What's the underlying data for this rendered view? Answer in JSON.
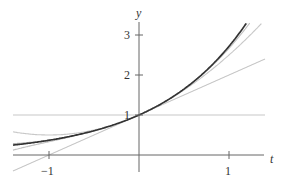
{
  "chart_data": {
    "type": "line",
    "title": "",
    "xlabel": "t",
    "ylabel": "y",
    "xlim": [
      -1.4,
      1.4
    ],
    "ylim": [
      -0.4,
      3.3
    ],
    "grid": false,
    "x_ticks": [
      {
        "value": -1,
        "label": "−1"
      },
      {
        "value": 1,
        "label": "1"
      }
    ],
    "y_ticks": [
      {
        "value": 1,
        "label": "1"
      },
      {
        "value": 2,
        "label": "2"
      },
      {
        "value": 3,
        "label": "3"
      }
    ],
    "series": [
      {
        "name": "e^t",
        "expr": "exp",
        "color": "#333333",
        "width": 1.6
      },
      {
        "name": "degree 0",
        "expr": "p0",
        "color": "#c8c8c8",
        "width": 1.1
      },
      {
        "name": "degree 1",
        "expr": "p1",
        "color": "#c8c8c8",
        "width": 1.1
      },
      {
        "name": "degree 2",
        "expr": "p2",
        "color": "#c8c8c8",
        "width": 1.1
      },
      {
        "name": "degree 3",
        "expr": "p3",
        "color": "#c0c0c0",
        "width": 1.1
      },
      {
        "name": "degree 4",
        "expr": "p4",
        "color": "#b0b0b0",
        "width": 1.1
      }
    ]
  },
  "axes": {
    "x_label": "t",
    "y_label": "y",
    "color": "#666666"
  }
}
